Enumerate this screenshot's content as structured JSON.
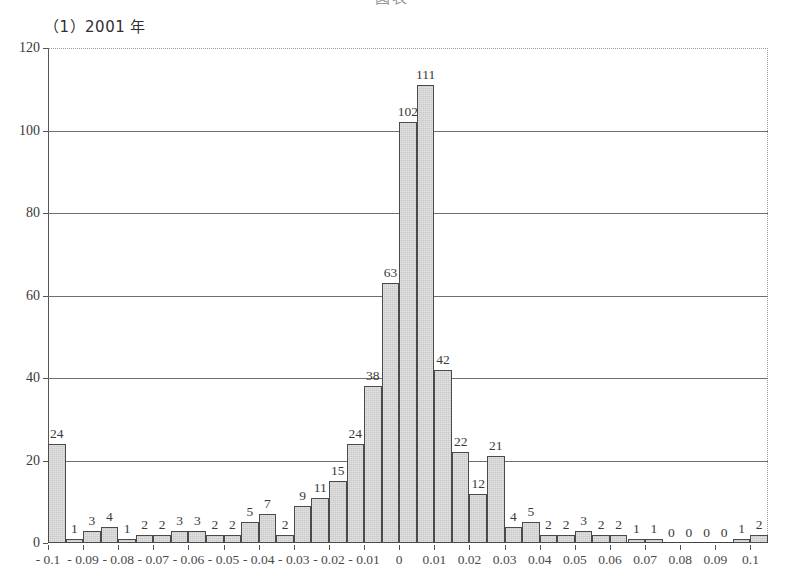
{
  "document": {
    "header_clipped_text": "図表 　　　　　　　　"
  },
  "panel": {
    "title": "（1）2001 年"
  },
  "chart_data": {
    "type": "bar",
    "title": "（1）2001 年",
    "xlabel": "",
    "ylabel": "",
    "ylim": [
      0,
      120
    ],
    "ytick_values": [
      0,
      20,
      40,
      60,
      80,
      100,
      120
    ],
    "ytick_labels": [
      "0",
      "20",
      "40",
      "60",
      "80",
      "100",
      "120"
    ],
    "grid": "horizontal",
    "legend": "none",
    "xtick_labels": [
      "- 0.1",
      "- 0.09",
      "- 0.08",
      "- 0.07",
      "- 0.06",
      "- 0.05",
      "- 0.04",
      "- 0.03",
      "- 0.02",
      "- 0.01",
      "0",
      "0.01",
      "0.02",
      "0.03",
      "0.04",
      "0.05",
      "0.06",
      "0.07",
      "0.08",
      "0.09",
      "0.1"
    ],
    "categories": [
      "-0.10",
      "-0.095",
      "-0.09",
      "-0.085",
      "-0.08",
      "-0.075",
      "-0.07",
      "-0.065",
      "-0.06",
      "-0.055",
      "-0.05",
      "-0.045",
      "-0.04",
      "-0.035",
      "-0.03",
      "-0.025",
      "-0.02",
      "-0.015",
      "-0.01",
      "-0.005",
      "0.00",
      "0.005",
      "0.01",
      "0.015",
      "0.02",
      "0.025",
      "0.03",
      "0.035",
      "0.04",
      "0.045",
      "0.05",
      "0.055",
      "0.06",
      "0.065",
      "0.07",
      "0.075",
      "0.08",
      "0.085",
      "0.09",
      "0.095",
      "0.10"
    ],
    "values": [
      24,
      1,
      3,
      4,
      1,
      2,
      2,
      3,
      3,
      2,
      2,
      5,
      7,
      2,
      9,
      11,
      15,
      24,
      38,
      63,
      102,
      111,
      42,
      22,
      12,
      21,
      4,
      5,
      2,
      2,
      3,
      2,
      2,
      1,
      1,
      0,
      0,
      0,
      0,
      1,
      2
    ],
    "value_labels": [
      "24",
      "1",
      "3",
      "4",
      "1",
      "2",
      "2",
      "3",
      "3",
      "2",
      "2",
      "5",
      "7",
      "2",
      "9",
      "11",
      "15",
      "24",
      "38",
      "63",
      "102",
      "111",
      "42",
      "22",
      "12",
      "21",
      "4",
      "5",
      "2",
      "2",
      "3",
      "2",
      "2",
      "1",
      "1",
      "0",
      "0",
      "0",
      "0",
      "1",
      "2"
    ]
  },
  "colors": {
    "bar_fill": "#c9c9c9",
    "bar_stroke": "#4a4a4a",
    "gridline": "#6f6f6f",
    "axis": "#444444",
    "text": "#3a3a3a",
    "background": "#ffffff"
  }
}
